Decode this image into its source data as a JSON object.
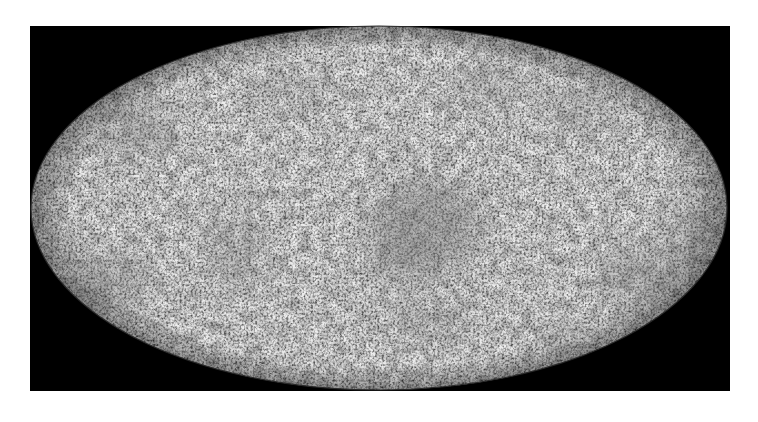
{
  "figure": {
    "projection": "mollweide",
    "colormap": "grayscale",
    "background_color": "#000000",
    "page_background": "#ffffff",
    "base_tone": "#d2d2d2",
    "light_tone": "#ececec",
    "dark_tone": "#6e6e6e",
    "frame": {
      "x": 30,
      "y": 26,
      "width": 700,
      "height": 365
    },
    "ellipse": {
      "cx": 379,
      "cy": 208,
      "rx": 348,
      "ry": 182
    },
    "dark_regions": [
      {
        "name": "center-cold-spot",
        "cx": 425,
        "cy": 225,
        "rx": 55,
        "ry": 45,
        "opacity": 0.55
      },
      {
        "name": "center-lower",
        "cx": 400,
        "cy": 262,
        "rx": 35,
        "ry": 22,
        "opacity": 0.35
      },
      {
        "name": "upper-left",
        "cx": 135,
        "cy": 130,
        "rx": 40,
        "ry": 28,
        "opacity": 0.4
      },
      {
        "name": "left-lower",
        "cx": 110,
        "cy": 280,
        "rx": 38,
        "ry": 25,
        "opacity": 0.45
      },
      {
        "name": "left-mid",
        "cx": 235,
        "cy": 250,
        "rx": 30,
        "ry": 40,
        "opacity": 0.3
      },
      {
        "name": "lower-right",
        "cx": 640,
        "cy": 275,
        "rx": 45,
        "ry": 28,
        "opacity": 0.45
      },
      {
        "name": "right-edge",
        "cx": 690,
        "cy": 230,
        "rx": 25,
        "ry": 30,
        "opacity": 0.4
      },
      {
        "name": "upper-right-a",
        "cx": 490,
        "cy": 85,
        "rx": 35,
        "ry": 20,
        "opacity": 0.35
      },
      {
        "name": "upper-right-b",
        "cx": 580,
        "cy": 110,
        "rx": 35,
        "ry": 22,
        "opacity": 0.35
      },
      {
        "name": "bottom-mid",
        "cx": 430,
        "cy": 320,
        "rx": 45,
        "ry": 20,
        "opacity": 0.3
      },
      {
        "name": "bottom-right",
        "cx": 560,
        "cy": 335,
        "rx": 30,
        "ry": 15,
        "opacity": 0.3
      },
      {
        "name": "top-left-mid",
        "cx": 290,
        "cy": 90,
        "rx": 40,
        "ry": 18,
        "opacity": 0.25
      }
    ]
  }
}
